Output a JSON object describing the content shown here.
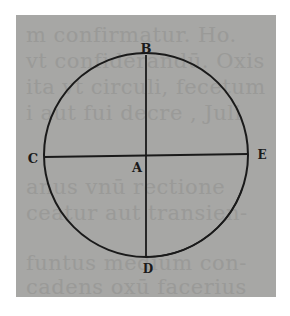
{
  "figure": {
    "type": "geometric circle diagram",
    "background_color": "#a7a7a5",
    "ink_color": "#1a1a1a",
    "circle": {
      "center": [
        146,
        155
      ],
      "radius": 102
    },
    "labels": {
      "top": "B",
      "left": "C",
      "center": "A",
      "right": "E",
      "bottom": "D"
    },
    "lines": [
      {
        "from": "B",
        "to": "D",
        "orientation": "vertical diameter"
      },
      {
        "from": "C",
        "to": "E",
        "orientation": "horizontal diameter"
      }
    ]
  },
  "bleed_through_text": [
    "m confirmatur. Ho.",
    "vt confiderandū. Oxis",
    "ita vt circuli, fecetum",
    "i aut fui decre , Juli",
    "...",
    "anus vnū rectione",
    "ceatur aut transien-",
    "uz",
    "funtus medium con-",
    "cadens oxū facerius"
  ]
}
